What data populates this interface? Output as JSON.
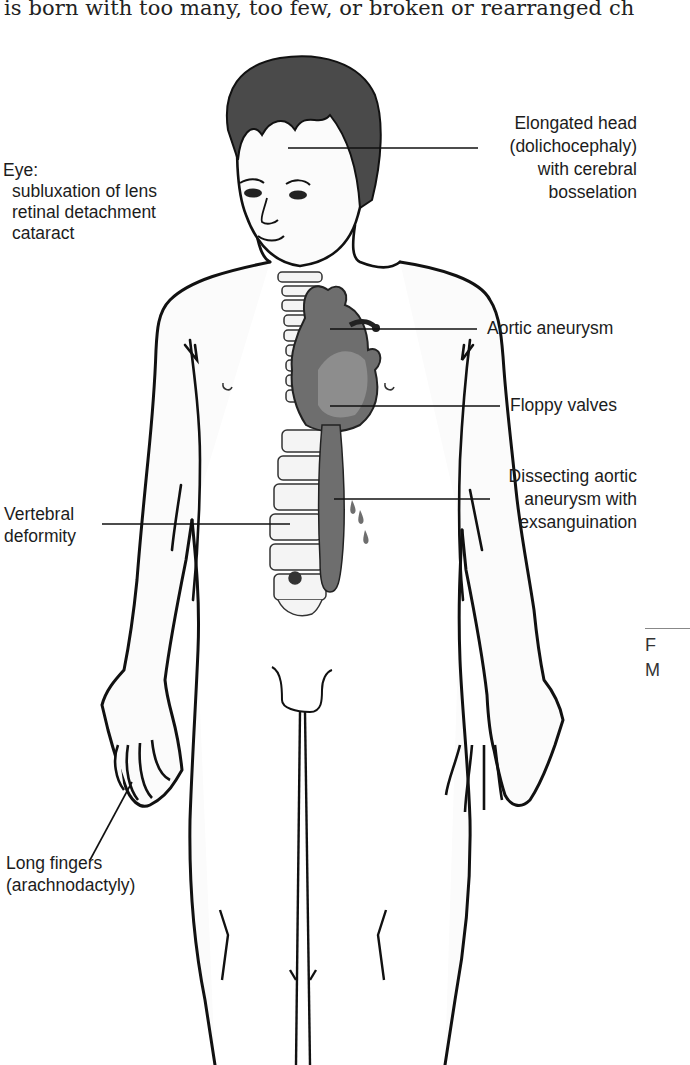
{
  "page": {
    "top_text": "is born with too many, too few, or broken or rearranged ch"
  },
  "figure": {
    "labels": {
      "eye": {
        "title": "Eye:",
        "items": [
          "subluxation of lens",
          "retinal detachment",
          "cataract"
        ]
      },
      "head": [
        "Elongated head",
        "(dolichocephaly)",
        "with cerebral",
        "bosselation"
      ],
      "aortic_aneurysm": "Aortic aneurysm",
      "floppy_valves": "Floppy valves",
      "dissecting": [
        "Dissecting aortic",
        "aneurysm with",
        "exsanguination"
      ],
      "vertebral": [
        "Vertebral",
        "deformity"
      ],
      "fingers": [
        "Long fingers",
        "(arachnodactyly)"
      ]
    },
    "colors": {
      "outline": "#111111",
      "heart_fill": "#6e6e6e",
      "heart_light": "#9a9a9a",
      "hair": "#4a4a4a",
      "skin": "#fafafa"
    }
  },
  "side_caption": {
    "line1": "F",
    "line2": "M"
  }
}
